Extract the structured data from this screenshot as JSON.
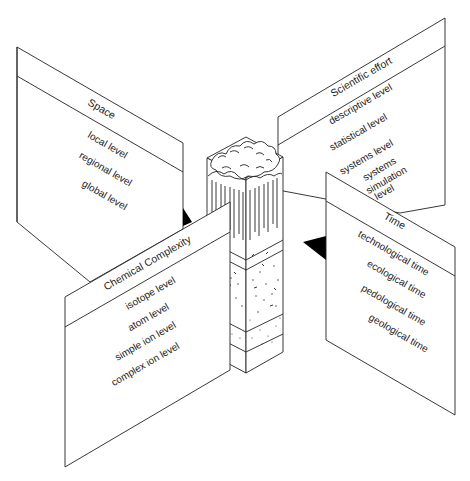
{
  "diagram": {
    "center": {
      "label": "soil-forest column",
      "layers": [
        "forest canopy",
        "humus/litter layer",
        "topsoil",
        "subsoil",
        "parent material"
      ]
    },
    "panels": {
      "space": {
        "title": "Space",
        "items": [
          "local level",
          "regional level",
          "global level"
        ]
      },
      "scientific_effort": {
        "title": "Scientific effort",
        "items": [
          "descriptive level",
          "statistical level",
          "systems level",
          "systems",
          "simulation",
          "level"
        ]
      },
      "time": {
        "title": "Time",
        "items": [
          "technological time",
          "ecological time",
          "pedological time",
          "geological time"
        ]
      },
      "chemical_complexity": {
        "title": "Chemical Complexity",
        "items": [
          "isotope level",
          "atom level",
          "simple ion level",
          "complex ion level"
        ]
      }
    },
    "colors": {
      "line": "#222222",
      "background": "#ffffff",
      "connector": "#000000"
    }
  }
}
